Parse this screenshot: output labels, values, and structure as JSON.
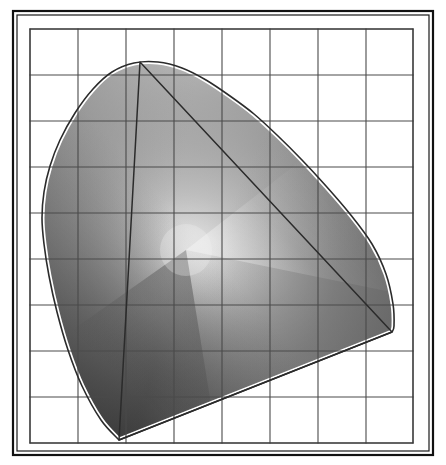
{
  "figure": {
    "background_color": "#ffffff",
    "frame": {
      "outer_rect": [
        13,
        11,
        420,
        444
      ],
      "outer_stroke": "#111111",
      "outer_stroke_width": 2.2,
      "inner_rect": [
        17,
        15,
        412,
        436
      ],
      "inner_stroke": "#1a1a1a",
      "inner_stroke_width": 1.2,
      "gap_fill": "#f7f7f7"
    }
  },
  "chart_data": {
    "type": "scatter",
    "subtitle": "",
    "xlabel": "",
    "ylabel": "",
    "xlim": [
      0,
      0.8
    ],
    "ylim": [
      0,
      0.9
    ],
    "grid": true,
    "legend_position": "none",
    "tick_labels_x": [],
    "tick_labels_y": [],
    "plot_rect_px": [
      30,
      29,
      383,
      414
    ],
    "grid_cols": 8,
    "grid_rows": 9,
    "grid_color": "#4a4a4a",
    "grid_width": 1.1,
    "grid_x_px": [
      30,
      78,
      126,
      174,
      222,
      270,
      318,
      366,
      413
    ],
    "grid_y_px": [
      29,
      75,
      121,
      167,
      213,
      259,
      305,
      351,
      397,
      443
    ],
    "spectral_locus": {
      "label": "spectral locus",
      "stroke": "#2b2b2b",
      "stroke_width": 1.6,
      "fill": "none",
      "points_px": [
        [
          119,
          440
        ],
        [
          101,
          420
        ],
        [
          82,
          386
        ],
        [
          68,
          350
        ],
        [
          57,
          312
        ],
        [
          49,
          276
        ],
        [
          44,
          244
        ],
        [
          42,
          218
        ],
        [
          44,
          192
        ],
        [
          50,
          166
        ],
        [
          60,
          140
        ],
        [
          75,
          113
        ],
        [
          93,
          89
        ],
        [
          112,
          72
        ],
        [
          134,
          63
        ],
        [
          158,
          62
        ],
        [
          182,
          68
        ],
        [
          206,
          80
        ],
        [
          230,
          96
        ],
        [
          254,
          114
        ],
        [
          278,
          136
        ],
        [
          302,
          160
        ],
        [
          326,
          186
        ],
        [
          350,
          214
        ],
        [
          372,
          244
        ],
        [
          386,
          274
        ],
        [
          393,
          304
        ],
        [
          394,
          326
        ],
        [
          392,
          332
        ]
      ]
    },
    "purple_line": {
      "label": "line of purples",
      "stroke": "#2b2b2b",
      "stroke_width": 1.6,
      "from_px": [
        392,
        332
      ],
      "to_px": [
        119,
        440
      ]
    },
    "gamut_triangle": {
      "label": "device gamut",
      "stroke": "#2b2b2b",
      "stroke_width": 1.5,
      "fill": "none",
      "vertices_px": [
        [
          119,
          440
        ],
        [
          140,
          62
        ],
        [
          392,
          332
        ]
      ]
    },
    "white_point": {
      "label": "white point",
      "position_px": [
        186,
        250
      ],
      "color": "#f2f2f2"
    },
    "fill": {
      "description": "grayscale gradient fill of the visible gamut",
      "light_gray": "#d8d8d8",
      "mid_gray": "#9a9a9a",
      "dark_gray": "#545454",
      "darkest_gray": "#3c3c3c",
      "highlight": "#f4f4f4"
    },
    "halo": {
      "description": "white halo between filled region and locus outline",
      "color": "#ffffff",
      "width_px": 5
    }
  }
}
